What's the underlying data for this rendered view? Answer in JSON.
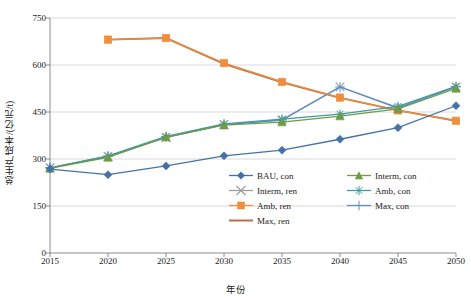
{
  "chart_data": {
    "type": "line",
    "title": "",
    "xlabel": "年份",
    "ylabel": "总生产成本/(亿元/t)",
    "categories": [
      2015,
      2020,
      2025,
      2030,
      2035,
      2040,
      2045,
      2050
    ],
    "x": [
      2015,
      2020,
      2025,
      2030,
      2035,
      2040,
      2045,
      2050
    ],
    "xlim": [
      2015,
      2050
    ],
    "ylim": [
      0,
      750
    ],
    "yticks": [
      0,
      150,
      300,
      450,
      600,
      750
    ],
    "xticks": [
      2015,
      2020,
      2025,
      2030,
      2035,
      2040,
      2045,
      2050
    ],
    "grid": "horizontal",
    "legend_position": "inside-bottom-right",
    "series": [
      {
        "name": "BAU, con",
        "color": "#4472a8",
        "marker": "diamond",
        "x": [
          2015,
          2020,
          2025,
          2030,
          2035,
          2040,
          2045,
          2050
        ],
        "values": [
          268,
          250,
          278,
          310,
          328,
          363,
          400,
          470
        ]
      },
      {
        "name": "Interm, con",
        "color": "#6f9a46",
        "marker": "triangle",
        "x": [
          2015,
          2020,
          2025,
          2030,
          2035,
          2040,
          2045,
          2050
        ],
        "values": [
          270,
          305,
          370,
          408,
          418,
          437,
          460,
          525
        ]
      },
      {
        "name": "Interm, ren",
        "color": "#9b9b9b",
        "marker": "x",
        "x": [
          2015,
          2020,
          2025,
          2030,
          2035,
          2040,
          2045,
          2050
        ],
        "values": [
          272,
          308,
          368,
          410,
          425,
          530,
          462,
          530
        ]
      },
      {
        "name": "Amb, con",
        "color": "#3d9aa8",
        "marker": "asterisk",
        "x": [
          2015,
          2020,
          2025,
          2030,
          2035,
          2040,
          2045,
          2050
        ],
        "values": [
          272,
          310,
          372,
          412,
          427,
          443,
          468,
          532
        ]
      },
      {
        "name": "Amb, ren",
        "color": "#ef8e3c",
        "marker": "square",
        "x": [
          2020,
          2025,
          2030,
          2035,
          2040,
          2045,
          2050
        ],
        "values": [
          681,
          686,
          606,
          546,
          496,
          455,
          422
        ]
      },
      {
        "name": "Max, con",
        "color": "#5b8fc9",
        "marker": "plus",
        "x": [
          2015,
          2020,
          2025,
          2030,
          2035,
          2040,
          2045,
          2050
        ],
        "values": [
          272,
          308,
          370,
          410,
          424,
          530,
          464,
          530
        ]
      },
      {
        "name": "Max, ren",
        "color": "#b5714a",
        "marker": "line",
        "x": [
          2020,
          2025,
          2030,
          2035,
          2040,
          2045,
          2050
        ],
        "values": [
          681,
          686,
          604,
          545,
          495,
          455,
          422
        ]
      }
    ]
  },
  "axis": {
    "y_label": "总生产成本/(亿元/t)",
    "x_label": "年份",
    "y_ticks": [
      "750",
      "600",
      "450",
      "300",
      "150",
      "0"
    ],
    "x_ticks": [
      "2015",
      "2020",
      "2025",
      "2030",
      "2035",
      "2040",
      "2045",
      "2050"
    ]
  },
  "legend": {
    "entries": [
      {
        "label": "BAU, con",
        "color": "#4472a8",
        "marker": "diamond"
      },
      {
        "label": "Interm, con",
        "color": "#6f9a46",
        "marker": "triangle"
      },
      {
        "label": "Interm, ren",
        "color": "#9b9b9b",
        "marker": "x"
      },
      {
        "label": "Amb, con",
        "color": "#3d9aa8",
        "marker": "asterisk"
      },
      {
        "label": "Amb, ren",
        "color": "#ef8e3c",
        "marker": "square"
      },
      {
        "label": "Max, con",
        "color": "#5b8fc9",
        "marker": "plus"
      },
      {
        "label": "Max, ren",
        "color": "#b5714a",
        "marker": "line"
      }
    ]
  }
}
